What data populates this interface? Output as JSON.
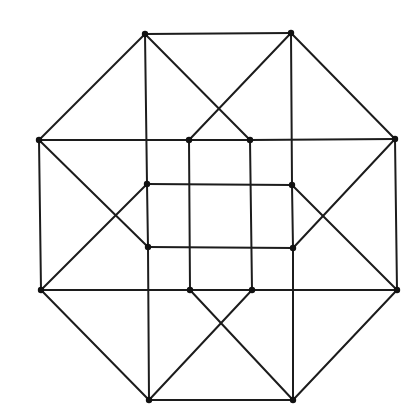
{
  "diagram": {
    "type": "graph",
    "colors": {
      "edge": "#1c1c1c",
      "vertex": "#111111",
      "background": "#ffffff"
    },
    "vertices": [
      {
        "id": "A",
        "x": 145,
        "y": 34
      },
      {
        "id": "B",
        "x": 291,
        "y": 33
      },
      {
        "id": "C",
        "x": 39,
        "y": 140
      },
      {
        "id": "D",
        "x": 395,
        "y": 139
      },
      {
        "id": "E",
        "x": 41,
        "y": 290
      },
      {
        "id": "F",
        "x": 397,
        "y": 290
      },
      {
        "id": "G",
        "x": 149,
        "y": 400
      },
      {
        "id": "H",
        "x": 293,
        "y": 400
      },
      {
        "id": "I",
        "x": 189,
        "y": 140
      },
      {
        "id": "J",
        "x": 250,
        "y": 140
      },
      {
        "id": "K",
        "x": 147,
        "y": 184
      },
      {
        "id": "L",
        "x": 292,
        "y": 185
      },
      {
        "id": "M",
        "x": 148,
        "y": 247
      },
      {
        "id": "N",
        "x": 293,
        "y": 248
      },
      {
        "id": "O",
        "x": 190,
        "y": 290
      },
      {
        "id": "P",
        "x": 252,
        "y": 290
      }
    ],
    "edges": [
      [
        "A",
        "B"
      ],
      [
        "A",
        "C"
      ],
      [
        "B",
        "D"
      ],
      [
        "C",
        "E"
      ],
      [
        "D",
        "F"
      ],
      [
        "E",
        "G"
      ],
      [
        "F",
        "H"
      ],
      [
        "G",
        "H"
      ],
      [
        "A",
        "K"
      ],
      [
        "A",
        "J"
      ],
      [
        "B",
        "L"
      ],
      [
        "B",
        "I"
      ],
      [
        "C",
        "I"
      ],
      [
        "C",
        "M"
      ],
      [
        "D",
        "J"
      ],
      [
        "D",
        "N"
      ],
      [
        "E",
        "O"
      ],
      [
        "E",
        "K"
      ],
      [
        "F",
        "P"
      ],
      [
        "F",
        "L"
      ],
      [
        "G",
        "M"
      ],
      [
        "G",
        "P"
      ],
      [
        "H",
        "N"
      ],
      [
        "H",
        "O"
      ],
      [
        "I",
        "J"
      ],
      [
        "I",
        "O"
      ],
      [
        "J",
        "P"
      ],
      [
        "O",
        "P"
      ],
      [
        "K",
        "L"
      ],
      [
        "K",
        "M"
      ],
      [
        "L",
        "N"
      ],
      [
        "M",
        "N"
      ]
    ]
  }
}
